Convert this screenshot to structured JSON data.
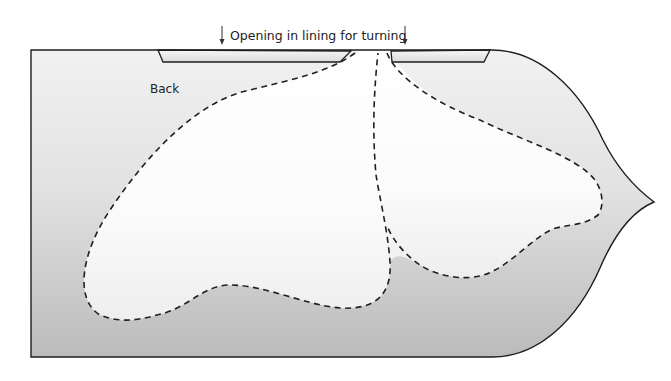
{
  "diagram": {
    "title": "Opening in lining for turning",
    "piece_label": "Back",
    "annotations": [
      {
        "type": "arrow-down",
        "position": "left-of-title"
      },
      {
        "type": "arrow-down",
        "position": "right-of-title"
      }
    ],
    "elements": {
      "pattern_piece": "Back",
      "opening_strips": 2,
      "stitch_lines": "dashed",
      "pockets": 2
    },
    "colors": {
      "piece_top": "#f0f0f0",
      "piece_bottom": "#bcbcbc",
      "pocket_fill": "#ffffff",
      "outline": "#1e1e1e",
      "background": "#ffffff"
    }
  }
}
